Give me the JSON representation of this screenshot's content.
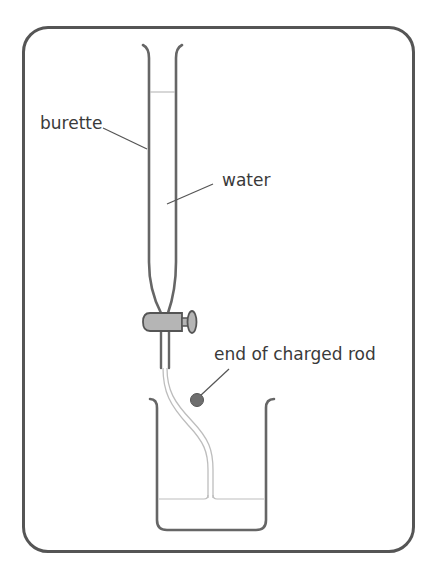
{
  "diagram": {
    "labels": {
      "burette": "burette",
      "water": "water",
      "rod": "end of charged rod"
    },
    "colors": {
      "outline": "#555555",
      "glass": "#666666",
      "water_line": "#b8b8b8",
      "tap_fill": "#b5b5b5",
      "rod_fill": "#6e6e6e",
      "text": "#3a3a3a"
    },
    "components": [
      "frame",
      "burette",
      "water-column",
      "tap",
      "nozzle",
      "water-stream",
      "charged-rod-end",
      "beaker",
      "beaker-water"
    ]
  }
}
